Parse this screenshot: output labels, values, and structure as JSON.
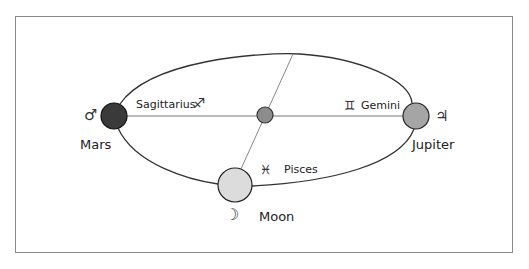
{
  "diagram": {
    "bodies": [
      {
        "id": "mars",
        "label": "Mars",
        "symbol": "♂",
        "color": "#3a3a3a"
      },
      {
        "id": "sun",
        "label": "",
        "symbol": "",
        "color": "#8c8c8c"
      },
      {
        "id": "jupiter",
        "label": "Jupiter",
        "symbol": "♃",
        "color": "#a5a5a5"
      },
      {
        "id": "moon",
        "label": "Moon",
        "symbol": "☽",
        "color": "#dcdcdc"
      }
    ],
    "signs": [
      {
        "id": "sagittarius",
        "label": "Sagittarius",
        "symbol": "♐"
      },
      {
        "id": "gemini",
        "label": "Gemini",
        "symbol": "♊"
      },
      {
        "id": "pisces",
        "label": "Pisces",
        "symbol": "♓"
      }
    ]
  },
  "labels": {
    "mars": "Mars",
    "jupiter": "Jupiter",
    "moon": "Moon",
    "sagittarius": "Sagittarius",
    "gemini": "Gemini",
    "pisces": "Pisces"
  },
  "symbols": {
    "mars": "♂",
    "jupiter": "♃",
    "moon": "☽",
    "sagittarius": "♐",
    "gemini": "♊",
    "pisces": "♓"
  }
}
